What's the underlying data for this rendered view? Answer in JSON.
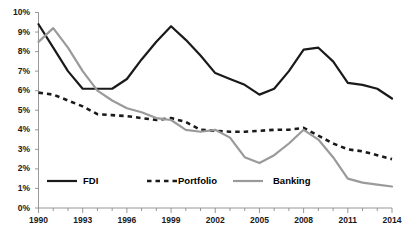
{
  "chart_data": {
    "type": "line",
    "title": "",
    "subtitle": "",
    "xlabel": "",
    "ylabel": "",
    "xlim": [
      1990,
      2014
    ],
    "ylim": [
      0,
      10
    ],
    "grid": false,
    "legend_position": "bottom",
    "y_tick_labels": [
      "10%",
      "9%",
      "8%",
      "7%",
      "6%",
      "5%",
      "4%",
      "3%",
      "2%",
      "1%",
      "0%"
    ],
    "y_tick_values": [
      10,
      9,
      8,
      7,
      6,
      5,
      4,
      3,
      2,
      1,
      0
    ],
    "x_tick_labels": [
      "1990",
      "1993",
      "1996",
      "1999",
      "2002",
      "2005",
      "2008",
      "2011",
      "2014"
    ],
    "x_tick_values": [
      1990,
      1993,
      1996,
      1999,
      2002,
      2005,
      2008,
      2011,
      2014
    ],
    "x": [
      1990,
      1991,
      1992,
      1993,
      1994,
      1995,
      1996,
      1997,
      1998,
      1999,
      2000,
      2001,
      2002,
      2003,
      2004,
      2005,
      2006,
      2007,
      2008,
      2009,
      2010,
      2011,
      2012,
      2013,
      2014
    ],
    "series": [
      {
        "name": "FDI",
        "color": "#1a1a1a",
        "style": "solid",
        "values": [
          9.4,
          8.2,
          7.0,
          6.1,
          6.1,
          6.1,
          6.6,
          7.6,
          8.5,
          9.3,
          8.6,
          7.8,
          6.9,
          6.6,
          6.3,
          5.8,
          6.1,
          7.0,
          8.1,
          8.2,
          7.5,
          6.4,
          6.3,
          6.1,
          5.6
        ]
      },
      {
        "name": "Portfolio",
        "color": "#1a1a1a",
        "style": "dashed",
        "values": [
          5.9,
          5.8,
          5.5,
          5.2,
          4.8,
          4.75,
          4.7,
          4.6,
          4.5,
          4.6,
          4.4,
          4.0,
          3.95,
          3.9,
          3.9,
          3.95,
          4.0,
          4.0,
          4.1,
          3.7,
          3.3,
          3.0,
          2.9,
          2.7,
          2.5
        ]
      },
      {
        "name": "Banking",
        "color": "#9a9a9a",
        "style": "solid",
        "values": [
          8.5,
          9.2,
          8.2,
          7.0,
          6.0,
          5.5,
          5.1,
          4.9,
          4.6,
          4.5,
          4.0,
          3.9,
          4.0,
          3.6,
          2.6,
          2.3,
          2.7,
          3.3,
          4.0,
          3.5,
          2.6,
          1.5,
          1.3,
          1.2,
          1.1
        ]
      }
    ]
  },
  "legend": {
    "items": [
      {
        "label": "FDI",
        "color": "#1a1a1a",
        "style": "solid"
      },
      {
        "label": "Portfolio",
        "color": "#1a1a1a",
        "style": "dashed"
      },
      {
        "label": "Banking",
        "color": "#9a9a9a",
        "style": "solid"
      }
    ]
  },
  "axis": {
    "line_color": "#8c8c8c"
  }
}
